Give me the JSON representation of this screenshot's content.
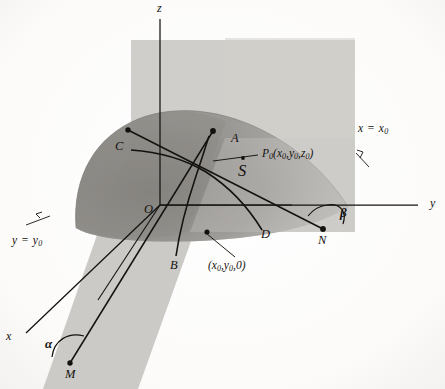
{
  "figure": {
    "kind": "3d-surface-tangent-lines-diagram",
    "background_color": "#fdfdfc",
    "ink_color": "#14120f"
  },
  "axes": {
    "z_label": "z",
    "y_label": "y",
    "x_label": "x",
    "origin_label": "O"
  },
  "planes": [
    {
      "name": "plane-x-equals-x0",
      "label_var": "x",
      "label_eq": "=",
      "label_value": "x",
      "label_sub": "0",
      "fill": "#c9c7c3"
    },
    {
      "name": "plane-y-equals-y0",
      "label_var": "y",
      "label_eq": "=",
      "label_value": "y",
      "label_sub": "0",
      "fill": "#c2c0bc"
    }
  ],
  "surface": {
    "label": "S",
    "fill_light": "#b6b4b0",
    "fill_dark": "#8e8c88"
  },
  "points": [
    {
      "name": "point-A",
      "label": "A"
    },
    {
      "name": "point-B",
      "label": "B"
    },
    {
      "name": "point-C",
      "label": "C"
    },
    {
      "name": "point-D",
      "label": "D"
    },
    {
      "name": "point-M",
      "label": "M"
    },
    {
      "name": "point-N",
      "label": "N"
    },
    {
      "name": "point-O",
      "label": "O"
    }
  ],
  "labels": {
    "P0": {
      "base": "P",
      "base_sub": "0",
      "open": "(",
      "x": "x",
      "x_sub": "0",
      "c1": ",",
      "y": "y",
      "y_sub": "0",
      "c2": ",",
      "z": "z",
      "z_sub": "0",
      "close": ")"
    },
    "foot": {
      "open": "(",
      "x": "x",
      "x_sub": "0",
      "c1": ",",
      "y": "y",
      "y_sub": "0",
      "c2": ",",
      "zero": "0",
      "close": ")"
    },
    "alpha": "α",
    "beta": "β"
  },
  "text_strings": {
    "P0_full": "P0(x0,y0,z0)",
    "foot_full": "(x0,y0,0)",
    "plane_x_full": "x = x0",
    "plane_y_full": "y = y0"
  }
}
